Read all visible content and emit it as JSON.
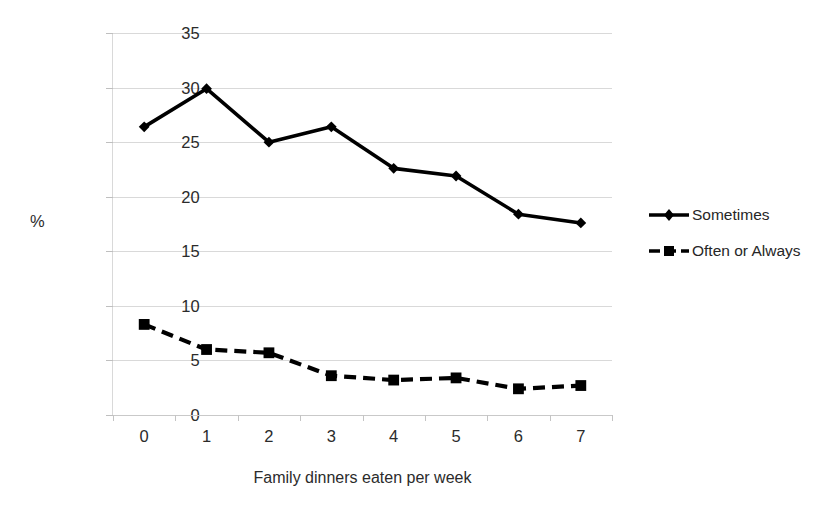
{
  "chart_data": {
    "type": "line",
    "title": "",
    "xlabel": "Family dinners eaten per week",
    "ylabel": "%",
    "categories": [
      "0",
      "1",
      "2",
      "3",
      "4",
      "5",
      "6",
      "7"
    ],
    "x": [
      0,
      1,
      2,
      3,
      4,
      5,
      6,
      7
    ],
    "ylim": [
      0,
      35
    ],
    "ytick_step": 5,
    "ytick_labels": [
      "0",
      "5",
      "10",
      "15",
      "20",
      "25",
      "30",
      "35"
    ],
    "grid": "horizontal",
    "legend_position": "right",
    "series": [
      {
        "name": "Sometimes",
        "marker": "diamond",
        "linestyle": "solid",
        "color": "#000000",
        "values": [
          26.4,
          29.9,
          25.0,
          26.4,
          22.6,
          21.9,
          18.4,
          17.6
        ]
      },
      {
        "name": "Often or Always",
        "marker": "square",
        "linestyle": "dashed",
        "color": "#000000",
        "values": [
          8.3,
          6.0,
          5.7,
          3.6,
          3.2,
          3.4,
          2.4,
          2.7
        ]
      }
    ]
  },
  "legend": {
    "items": [
      {
        "label": "Sometimes"
      },
      {
        "label": "Often or Always"
      }
    ]
  },
  "colors": {
    "background": "#ffffff",
    "gridline": "#d9d9d9",
    "series": "#000000",
    "text": "#262626"
  }
}
